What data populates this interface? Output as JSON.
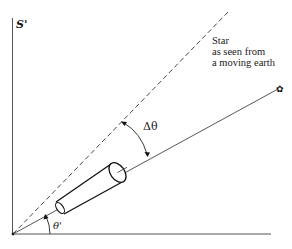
{
  "frame_label": "S'",
  "star_caption": {
    "lines": [
      "Star",
      "as seen from",
      "a moving earth"
    ]
  },
  "angles": {
    "delta_theta": "Δθ",
    "theta_prime": "θ'"
  },
  "icons": {
    "star_symbol": "✿"
  },
  "elements": {
    "vertical_axis": "S' frame vertical axis",
    "horizontal_axis": "S' frame horizontal axis",
    "dashed_line": "true star direction (dashed)",
    "solid_line": "apparent star direction",
    "telescope": "telescope tilted toward apparent star"
  },
  "colors": {
    "ink": "#1a1a1a",
    "axis": "#555555",
    "background": "#ffffff"
  }
}
